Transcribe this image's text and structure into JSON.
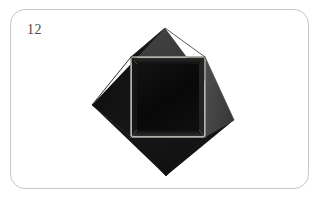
{
  "card": {
    "figure_number": "12",
    "background_color": "#ffffff",
    "border_color": "#c6c6cb",
    "border_radius": 15,
    "label_color": "#4a4a4a"
  },
  "figure": {
    "name": "folded-paper-diamond",
    "outer_diamond": {
      "vertices": [
        [
          165,
          28
        ],
        [
          234,
          120
        ],
        [
          166,
          176
        ],
        [
          92,
          105
        ]
      ],
      "top_right_facet_color": "#3b3b3b",
      "right_facet_color": "#4a4a4a",
      "left_facet_color": "#0f0f0f",
      "bottom_facet_color": "#131313"
    },
    "inner_square": {
      "x": 131,
      "y": 57,
      "width": 74,
      "height": 80,
      "fill_color": "#0a0a0a",
      "outline_color": "#a3a39c",
      "outline_width": 1.6,
      "inner_bevel_color": "#1c1c1c"
    },
    "crease_lines": [
      {
        "from": [
          165,
          28
        ],
        "to": [
          165,
          57
        ],
        "color": "#2b2b2b"
      },
      {
        "from": [
          234,
          120
        ],
        "to": [
          205,
          120
        ],
        "color": "#3a3a3a"
      },
      {
        "from": [
          166,
          176
        ],
        "to": [
          166,
          137
        ],
        "color": "#151515"
      },
      {
        "from": [
          92,
          105
        ],
        "to": [
          131,
          105
        ],
        "color": "#101010"
      }
    ]
  }
}
